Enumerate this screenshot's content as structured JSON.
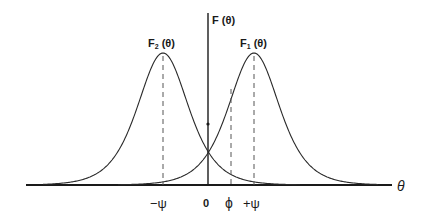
{
  "diagram": {
    "y_axis_label": "F (θ)",
    "x_axis_label": "θ",
    "curves": [
      {
        "id": "F2",
        "label_main": "F",
        "label_sub": "2",
        "label_arg": " (θ)",
        "peak_at": "-ψ"
      },
      {
        "id": "F1",
        "label_main": "F",
        "label_sub": "1",
        "label_arg": " (θ)",
        "peak_at": "+ψ"
      }
    ],
    "ticks": {
      "minus_psi": "−ψ",
      "zero": "0",
      "phi": "ϕ",
      "plus_psi": "+ψ"
    }
  }
}
